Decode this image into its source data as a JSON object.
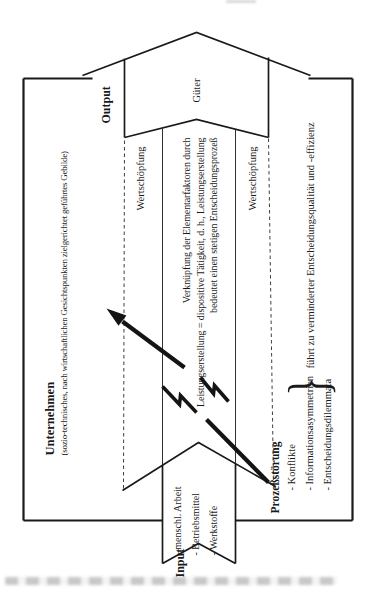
{
  "figure": {
    "company": {
      "title": "Unternehmen",
      "subtitle": "(sozio-technisches, nach wirtschaftlichen Gesichtspunkten zielgerichtet geführtes Gebilde)"
    },
    "output": {
      "label": "Output",
      "arrow_text": "Güter"
    },
    "input": {
      "label": "Input",
      "items": [
        "- menschl. Arbeit",
        "- Betriebsmittel",
        "- Werkstoffe"
      ]
    },
    "value_creation": {
      "upper": "Wertschöpfung",
      "lower": "Wertschöpfung"
    },
    "process_arrow_label": "Leistungserstellung =",
    "central_statement": {
      "line1": "Verknüpfung der Elementarfaktoren durch",
      "line2": "dispositive Tätigkeit, d. h., Leistungserstellung",
      "line3": "bedeutet einen stetigen Entscheidungsprozeß"
    },
    "disturbance": {
      "title": "Prozeßstörung",
      "items": [
        "- Konflikte",
        "- Informationsasymmetrien",
        "- Entscheidungsdilemmata"
      ],
      "brace": "}",
      "consequence": "führt zu verminderter Entscheidungsqualität und -effizienz"
    }
  },
  "colors": {
    "ink": "#1a1a1a",
    "paper": "#ffffff"
  }
}
